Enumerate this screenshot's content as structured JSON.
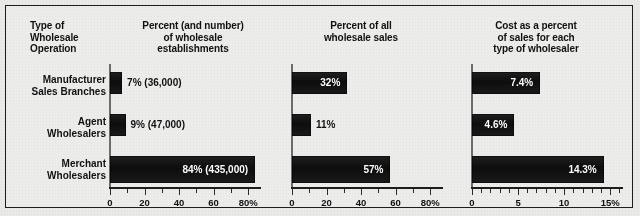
{
  "figure": {
    "background_color": "#e9e9e7",
    "border_color": "#1d1d1d",
    "bar_color": "#151515",
    "inline_label_color": "#ffffff",
    "outside_label_color": "#111111"
  },
  "headers": {
    "row_label_header": "Type of\nWholesale\nOperation",
    "row_label_header_line1": "Type of",
    "row_label_header_line2": "Wholesale",
    "row_label_header_line3": "Operation",
    "panel1_line1": "Percent (and number)",
    "panel1_line2": "of wholesale",
    "panel1_line3": "establishments",
    "panel2_line1": "Percent of all",
    "panel2_line2": "wholesale sales",
    "panel3_line1": "Cost as a percent",
    "panel3_line2": "of sales for each",
    "panel3_line3": "type of wholesaler"
  },
  "rows": [
    {
      "line1": "Manufacturer",
      "line2": "Sales Branches"
    },
    {
      "line1": "Agent",
      "line2": "Wholesalers"
    },
    {
      "line1": "Merchant",
      "line2": "Wholesalers"
    }
  ],
  "axis_labels": {
    "panel1": [
      "0",
      "20",
      "40",
      "60",
      "80%"
    ],
    "panel2": [
      "0",
      "20",
      "40",
      "60",
      "80%"
    ],
    "panel3": [
      "0",
      "5",
      "10",
      "15%"
    ]
  },
  "bar_labels": {
    "panel1": [
      "7% (36,000)",
      "9% (47,000)",
      "84% (435,000)"
    ],
    "panel2": [
      "32%",
      "11%",
      "57%"
    ],
    "panel3": [
      "7.4%",
      "4.6%",
      "14.3%"
    ]
  },
  "chart_data": [
    {
      "type": "bar",
      "orientation": "horizontal",
      "title": "Percent (and number) of wholesale establishments",
      "xlabel": "",
      "ylabel": "Type of Wholesale Operation",
      "categories": [
        "Manufacturer Sales Branches",
        "Agent Wholesalers",
        "Merchant Wholesalers"
      ],
      "values": [
        7,
        9,
        84
      ],
      "data_labels": [
        "7% (36,000)",
        "9% (47,000)",
        "84% (435,000)"
      ],
      "counts": [
        36000,
        47000,
        435000
      ],
      "xlim": [
        0,
        88
      ],
      "xticks": [
        0,
        20,
        40,
        60,
        80
      ],
      "xticklabels": [
        "0",
        "20",
        "40",
        "60",
        "80%"
      ],
      "minor_tick_step": 10,
      "grid": false,
      "legend": "none"
    },
    {
      "type": "bar",
      "orientation": "horizontal",
      "title": "Percent of all wholesale sales",
      "xlabel": "",
      "ylabel": "",
      "categories": [
        "Manufacturer Sales Branches",
        "Agent Wholesalers",
        "Merchant Wholesalers"
      ],
      "values": [
        32,
        11,
        57
      ],
      "data_labels": [
        "32%",
        "11%",
        "57%"
      ],
      "xlim": [
        0,
        88
      ],
      "xticks": [
        0,
        20,
        40,
        60,
        80
      ],
      "xticklabels": [
        "0",
        "20",
        "40",
        "60",
        "80%"
      ],
      "minor_tick_step": 10,
      "grid": false,
      "legend": "none"
    },
    {
      "type": "bar",
      "orientation": "horizontal",
      "title": "Cost as a percent of sales for each type of wholesaler",
      "xlabel": "",
      "ylabel": "",
      "categories": [
        "Manufacturer Sales Branches",
        "Agent Wholesalers",
        "Merchant Wholesalers"
      ],
      "values": [
        7.4,
        4.6,
        14.3
      ],
      "data_labels": [
        "7.4%",
        "4.6%",
        "14.3%"
      ],
      "xlim": [
        0,
        16.5
      ],
      "xticks": [
        0,
        5,
        10,
        15
      ],
      "xticklabels": [
        "0",
        "5",
        "10",
        "15%"
      ],
      "minor_tick_step": 1,
      "grid": false,
      "legend": "none"
    }
  ]
}
